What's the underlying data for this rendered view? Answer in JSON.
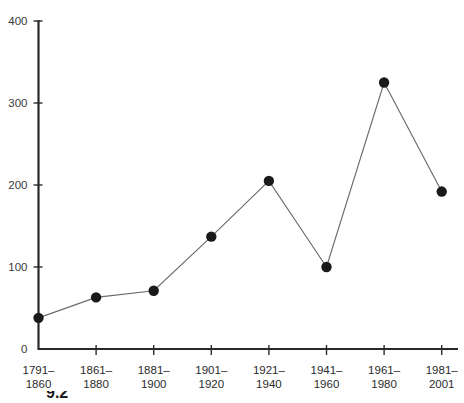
{
  "figure": {
    "caption_fragment": "9.2"
  },
  "chart_data": {
    "type": "line",
    "title": "",
    "subtitle": "",
    "xlabel": "",
    "ylabel": "",
    "categories": [
      "1791–\n1860",
      "1861–\n1880",
      "1881–\n1900",
      "1901–\n1920",
      "1921–\n1940",
      "1941–\n1960",
      "1961–\n1980",
      "1981–\n2001"
    ],
    "category_lines": [
      [
        "1791–",
        "1860"
      ],
      [
        "1861–",
        "1880"
      ],
      [
        "1881–",
        "1900"
      ],
      [
        "1901–",
        "1920"
      ],
      [
        "1921–",
        "1940"
      ],
      [
        "1941–",
        "1960"
      ],
      [
        "1961–",
        "1980"
      ],
      [
        "1981–",
        "2001"
      ]
    ],
    "values": [
      38,
      63,
      71,
      137,
      205,
      100,
      325,
      192
    ],
    "ylim": [
      0,
      400
    ],
    "yticks": [
      0,
      100,
      200,
      300,
      400
    ],
    "ytick_labels": [
      "0",
      "100",
      "200",
      "300",
      "400"
    ],
    "grid": false,
    "legend": null,
    "legend_position": "none",
    "marker": "filled-circle",
    "marker_color": "#1a1a1a",
    "line_color": "#6b6b6b",
    "axis_color": "#2a2a2a",
    "background": "#ffffff"
  }
}
